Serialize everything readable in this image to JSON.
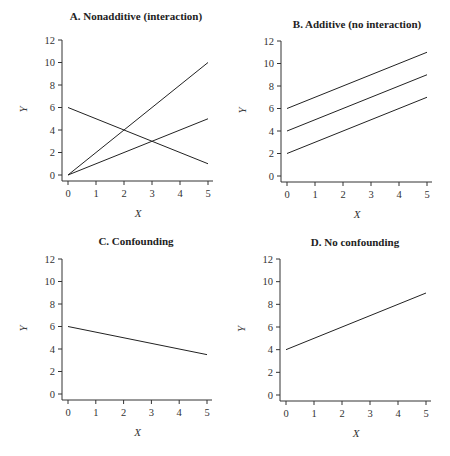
{
  "chart_data": [
    {
      "type": "line",
      "title": "A.  Nonadditive (interaction)",
      "xlabel": "X",
      "ylabel": "Y",
      "xlim": [
        0,
        5
      ],
      "ylim": [
        0,
        12
      ],
      "xticks": [
        "0",
        "1",
        "2",
        "3",
        "4",
        "5"
      ],
      "yticks": [
        "0",
        "2",
        "4",
        "6",
        "8",
        "10",
        "12"
      ],
      "series": [
        {
          "name": "line1",
          "x": [
            0,
            5
          ],
          "y": [
            0,
            10
          ]
        },
        {
          "name": "line2",
          "x": [
            0,
            5
          ],
          "y": [
            0,
            5
          ]
        },
        {
          "name": "line3",
          "x": [
            0,
            5
          ],
          "y": [
            6,
            1
          ]
        }
      ]
    },
    {
      "type": "line",
      "title": "B.  Additive (no interaction)",
      "xlabel": "X",
      "ylabel": "Y",
      "xlim": [
        0,
        5
      ],
      "ylim": [
        0,
        12
      ],
      "xticks": [
        "0",
        "1",
        "2",
        "3",
        "4",
        "5"
      ],
      "yticks": [
        "0",
        "2",
        "4",
        "6",
        "8",
        "10",
        "12"
      ],
      "series": [
        {
          "name": "line1",
          "x": [
            0,
            5
          ],
          "y": [
            2,
            7
          ]
        },
        {
          "name": "line2",
          "x": [
            0,
            5
          ],
          "y": [
            4,
            9
          ]
        },
        {
          "name": "line3",
          "x": [
            0,
            5
          ],
          "y": [
            6,
            11
          ]
        }
      ]
    },
    {
      "type": "line",
      "title": "C.  Confounding",
      "xlabel": "X",
      "ylabel": "Y",
      "xlim": [
        0,
        5
      ],
      "ylim": [
        0,
        12
      ],
      "xticks": [
        "0",
        "1",
        "2",
        "3",
        "4",
        "5"
      ],
      "yticks": [
        "0",
        "2",
        "4",
        "6",
        "8",
        "10",
        "12"
      ],
      "series": [
        {
          "name": "line1",
          "x": [
            0,
            5
          ],
          "y": [
            6,
            3.5
          ]
        }
      ]
    },
    {
      "type": "line",
      "title": "D.  No confounding",
      "xlabel": "X",
      "ylabel": "Y",
      "xlim": [
        0,
        5
      ],
      "ylim": [
        0,
        12
      ],
      "xticks": [
        "0",
        "1",
        "2",
        "3",
        "4",
        "5"
      ],
      "yticks": [
        "0",
        "2",
        "4",
        "6",
        "8",
        "10",
        "12"
      ],
      "series": [
        {
          "name": "line1",
          "x": [
            0,
            5
          ],
          "y": [
            4,
            9
          ]
        }
      ]
    }
  ],
  "layout": {
    "panels": [
      {
        "x0": 68,
        "x5": 208,
        "y0": 175,
        "y12": 40,
        "axisX": 62,
        "axisY": 181,
        "titleX": 136,
        "titleY": 20
      },
      {
        "x0": 287,
        "x5": 427,
        "y0": 176,
        "y12": 41,
        "axisX": 281,
        "axisY": 182,
        "titleX": 357,
        "titleY": 28
      },
      {
        "x0": 68,
        "x5": 207,
        "y0": 394,
        "y12": 259,
        "axisX": 62,
        "axisY": 400,
        "titleX": 136,
        "titleY": 245
      },
      {
        "x0": 286,
        "x5": 426,
        "y0": 395,
        "y12": 259,
        "axisX": 280,
        "axisY": 401,
        "titleX": 355,
        "titleY": 246
      }
    ]
  }
}
